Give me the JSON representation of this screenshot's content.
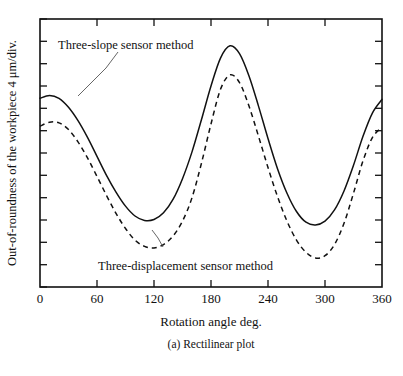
{
  "figure": {
    "caption": "(a) Rectilinear plot",
    "xlabel": "Rotation angle deg.",
    "ylabel": "Out-of-roundness of the workpiece 4 μm/div."
  },
  "annotations": {
    "solid": "Three-slope sensor method",
    "dashed": "Three-displacement sensor method"
  },
  "colors": {
    "ink": "#111111",
    "leader": "#555555",
    "background": "#ffffff"
  },
  "chart_data": {
    "type": "line",
    "title": "(a) Rectilinear plot",
    "xlabel": "Rotation angle deg.",
    "ylabel": "Out-of-roundness of the workpiece 4 μm/div.",
    "xlim": [
      0,
      360
    ],
    "ylim": [
      0,
      12
    ],
    "xticks": [
      0,
      60,
      120,
      180,
      240,
      300,
      360
    ],
    "xtick_labels": [
      "0",
      "60",
      "120",
      "180",
      "240",
      "300",
      "360"
    ],
    "yticks": [
      0,
      1,
      2,
      3,
      4,
      5,
      6,
      7,
      8,
      9,
      10,
      11,
      12
    ],
    "ytick_labels": [],
    "y_units": "4 μm per division",
    "grid": false,
    "legend": "annotated-inline",
    "x": [
      0,
      10,
      20,
      30,
      40,
      50,
      60,
      70,
      80,
      90,
      100,
      110,
      120,
      130,
      140,
      150,
      160,
      170,
      180,
      190,
      200,
      210,
      220,
      230,
      240,
      250,
      260,
      270,
      280,
      290,
      300,
      310,
      320,
      330,
      340,
      350,
      360
    ],
    "series": [
      {
        "name": "Three-slope sensor method",
        "style": "solid",
        "values": [
          8.45,
          8.58,
          8.45,
          8.05,
          7.45,
          6.7,
          5.85,
          5.0,
          4.25,
          3.62,
          3.18,
          2.98,
          3.02,
          3.32,
          3.92,
          4.85,
          6.05,
          7.5,
          9.0,
          10.25,
          10.8,
          10.45,
          9.45,
          8.1,
          6.65,
          5.3,
          4.2,
          3.38,
          2.9,
          2.78,
          2.95,
          3.45,
          4.3,
          5.45,
          6.75,
          7.8,
          8.4
        ]
      },
      {
        "name": "Three-displacement sensor method",
        "style": "dashed",
        "values": [
          7.2,
          7.38,
          7.35,
          7.05,
          6.5,
          5.78,
          4.95,
          4.1,
          3.3,
          2.62,
          2.1,
          1.82,
          1.75,
          1.9,
          2.28,
          2.95,
          4.0,
          5.55,
          7.3,
          8.85,
          9.5,
          9.15,
          8.1,
          6.75,
          5.35,
          4.05,
          2.95,
          2.1,
          1.55,
          1.3,
          1.4,
          1.9,
          2.85,
          4.2,
          5.65,
          6.7,
          7.15
        ]
      }
    ]
  }
}
